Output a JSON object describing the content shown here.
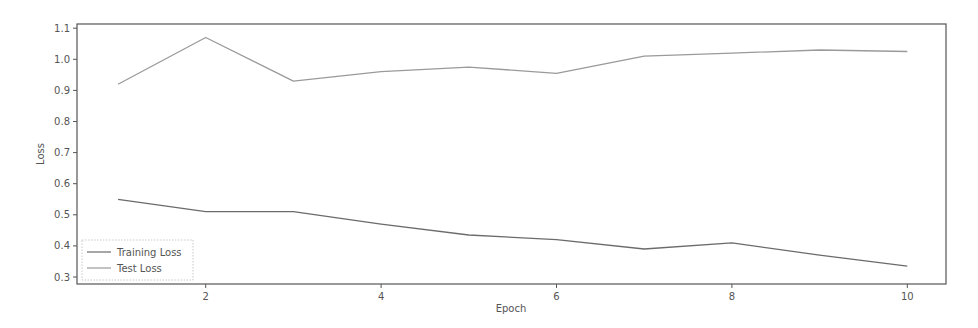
{
  "chart_data": {
    "type": "line",
    "title": "",
    "xlabel": "Epoch",
    "ylabel": "Loss",
    "x": [
      1,
      2,
      3,
      4,
      5,
      6,
      7,
      8,
      9,
      10
    ],
    "series": [
      {
        "name": "Training Loss",
        "color": "#6b6b6b",
        "values": [
          0.55,
          0.51,
          0.51,
          0.47,
          0.435,
          0.42,
          0.39,
          0.41,
          0.37,
          0.335
        ]
      },
      {
        "name": "Test Loss",
        "color": "#9a9a9a",
        "values": [
          0.92,
          1.07,
          0.93,
          0.96,
          0.975,
          0.955,
          1.01,
          1.02,
          1.03,
          1.025
        ]
      }
    ],
    "xticks": [
      2,
      4,
      6,
      8,
      10
    ],
    "xtick_labels": [
      "2",
      "4",
      "6",
      "8",
      "10"
    ],
    "yticks": [
      0.3,
      0.4,
      0.5,
      0.6,
      0.7,
      0.8,
      0.9,
      1.0,
      1.1
    ],
    "ytick_labels": [
      "0.3",
      "0.4",
      "0.5",
      "0.6",
      "0.7",
      "0.8",
      "0.9",
      "1.0",
      "1.1"
    ],
    "xlim": [
      0.55,
      10.45
    ],
    "ylim": [
      0.285,
      1.115
    ],
    "grid": false,
    "legend_position": "lower left"
  },
  "legend": {
    "items": [
      {
        "label": "Training Loss",
        "color": "#6b6b6b"
      },
      {
        "label": "Test Loss",
        "color": "#9a9a9a"
      }
    ]
  },
  "axes": {
    "xlabel": "Epoch",
    "ylabel": "Loss"
  }
}
